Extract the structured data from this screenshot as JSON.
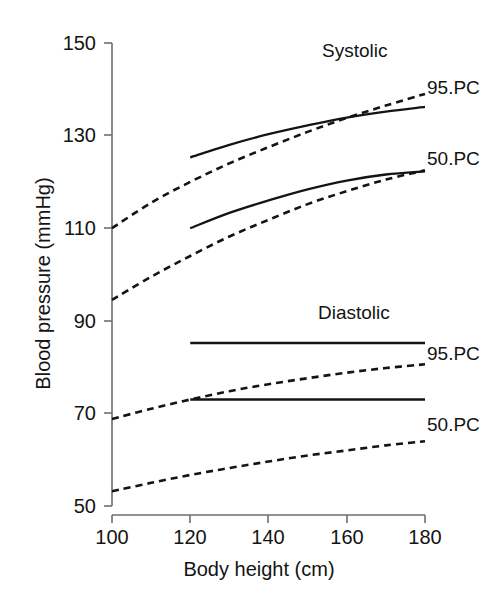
{
  "chart_data": {
    "type": "line",
    "title": "",
    "xlabel": "Body height (cm)",
    "ylabel": "Blood pressure (mmHg)",
    "xlim": [
      100,
      180
    ],
    "ylim": [
      50,
      150
    ],
    "xticks": [
      100,
      120,
      140,
      160,
      180
    ],
    "xtick_labels": [
      "100",
      "120",
      "140",
      "160",
      "180"
    ],
    "yticks": [
      50,
      70,
      90,
      110,
      130,
      150
    ],
    "ytick_labels": [
      "50",
      "70",
      "90",
      "110",
      "130",
      "150"
    ],
    "grid": false,
    "legend_position": "right-inline",
    "group_annotations": [
      {
        "text": "Systolic",
        "x": 152,
        "y": 144
      },
      {
        "text": "Diastolic",
        "x": 152,
        "y": 86
      }
    ],
    "series": [
      {
        "name": "Systolic 95.PC (dashed)",
        "label": "95.PC",
        "style": "dashed",
        "color": "#141414",
        "x": [
          100,
          110,
          120,
          130,
          140,
          150,
          160,
          170,
          180
        ],
        "y": [
          110.0,
          115.5,
          120.0,
          124.0,
          127.5,
          130.8,
          133.8,
          136.5,
          139.0
        ]
      },
      {
        "name": "Systolic 95.PC (solid)",
        "label": "95.PC",
        "style": "solid",
        "color": "#141414",
        "x": [
          120,
          130,
          140,
          150,
          160,
          170,
          180
        ],
        "y": [
          125.3,
          128.0,
          130.3,
          132.2,
          133.9,
          135.2,
          136.2
        ]
      },
      {
        "name": "Systolic 50.PC (dashed)",
        "label": "50.PC",
        "style": "dashed",
        "color": "#141414",
        "x": [
          100,
          110,
          120,
          130,
          140,
          150,
          160,
          170,
          180
        ],
        "y": [
          94.5,
          99.5,
          104.0,
          108.2,
          111.8,
          115.2,
          118.0,
          120.5,
          122.5
        ]
      },
      {
        "name": "Systolic 50.PC (solid)",
        "label": "50.PC",
        "style": "solid",
        "color": "#141414",
        "x": [
          120,
          130,
          140,
          150,
          160,
          170,
          180
        ],
        "y": [
          110.0,
          113.3,
          116.0,
          118.4,
          120.3,
          121.6,
          122.3
        ]
      },
      {
        "name": "Diastolic 95.PC (solid)",
        "label": "95.PC",
        "style": "solid",
        "color": "#141414",
        "x": [
          120,
          180
        ],
        "y": [
          85.2,
          85.2
        ]
      },
      {
        "name": "Diastolic 95.PC (dashed)",
        "label": "95.PC",
        "style": "dashed",
        "color": "#141414",
        "x": [
          100,
          110,
          120,
          130,
          140,
          150,
          160,
          170,
          180
        ],
        "y": [
          68.8,
          71.0,
          73.0,
          74.8,
          76.3,
          77.6,
          78.8,
          79.8,
          80.6
        ]
      },
      {
        "name": "Diastolic 50.PC (solid)",
        "label": "50.PC",
        "style": "solid",
        "color": "#141414",
        "x": [
          120,
          180
        ],
        "y": [
          73.0,
          73.0
        ]
      },
      {
        "name": "Diastolic 50.PC (dashed)",
        "label": "50.PC",
        "style": "dashed",
        "color": "#141414",
        "x": [
          100,
          110,
          120,
          130,
          140,
          150,
          160,
          170,
          180
        ],
        "y": [
          53.2,
          55.0,
          56.7,
          58.2,
          59.6,
          60.9,
          62.0,
          63.1,
          64.0
        ]
      }
    ]
  },
  "axis": {
    "ylabel": "Blood pressure (mmHg)",
    "xlabel": "Body height (cm)",
    "ytick_labels": [
      "150",
      "130",
      "110",
      "90",
      "70",
      "50"
    ],
    "xtick_labels": [
      "100",
      "120",
      "140",
      "160",
      "180"
    ],
    "axis_color": "#6e6e6e"
  },
  "annotations": {
    "systolic": "Systolic",
    "diastolic": "Diastolic",
    "systolic_95": "95.PC",
    "systolic_50": "50.PC",
    "diastolic_95": "95.PC",
    "diastolic_50": "50.PC"
  }
}
